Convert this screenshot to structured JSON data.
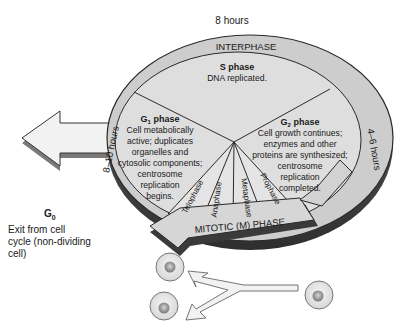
{
  "diagram": {
    "top_duration": "8 hours",
    "ring_label": "INTERPHASE",
    "left_duration": "8–10 hours",
    "right_duration": "4–6 hours",
    "s_phase": {
      "title": "S phase",
      "lines": [
        "DNA replicated."
      ]
    },
    "g1_phase": {
      "title": "G1 phase",
      "title_main": "G",
      "title_sub": "1",
      "title_rest": " phase",
      "lines": [
        "Cell metabolically",
        "active; duplicates",
        "organelles and",
        "cytosolic components;",
        "centrosome",
        "replication",
        "begins."
      ]
    },
    "g2_phase": {
      "title": "G2 phase",
      "title_main": "G",
      "title_sub": "2",
      "title_rest": " phase",
      "lines": [
        "Cell growth continues;",
        "enzymes and other",
        "proteins are synthesized;",
        "centrosome",
        "replication",
        "completed."
      ]
    },
    "mitotic_phases": [
      "Telophase",
      "Anaphase",
      "Metaphase",
      "Prophase"
    ],
    "mitotic_label": "MITOTIC (M) PHASE",
    "g0": {
      "title_main": "G",
      "title_sub": "0",
      "lines": [
        "Exit from cell",
        "cycle (non-dividing",
        "cell)"
      ]
    },
    "colors": {
      "disc_fill": "#dcdcdc",
      "ring_fill": "#cfcfcf",
      "edge_dark": "#5a5a5a",
      "arrow_fill": "#f2f2f2",
      "cell_fill": "#e6e6e6",
      "nucleus_fill": "#a8a8a8"
    }
  }
}
